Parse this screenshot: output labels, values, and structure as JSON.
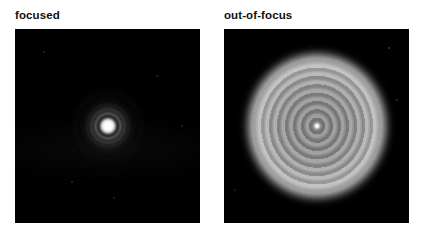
{
  "figure": {
    "background_color": "#ffffff",
    "label_color": "#100f10",
    "panel_background_color": "#000000",
    "panels": [
      {
        "id": "focused",
        "label": "focused",
        "description": "focused Airy diffraction pattern: small saturated white core surrounded by faint concentric rings on a black background",
        "pattern_type": "airy-disk",
        "core_color": "#ffffff",
        "ring_color": "#bebebe"
      },
      {
        "id": "out-of-focus",
        "label": "out-of-focus",
        "description": "defocused diffraction pattern: large soft-edged grey disk filled with concentric interference fringes and a tiny bright centre spot",
        "pattern_type": "defocused-disk",
        "disk_color": "#b4b4b4",
        "fringe_count": 8,
        "center_color": "#ffffff"
      }
    ]
  }
}
